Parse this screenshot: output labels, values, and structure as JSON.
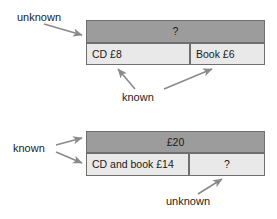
{
  "diagram": {
    "colors": {
      "bar_dark": "#9c9c9c",
      "bar_light": "#e9e9e9",
      "bar_border": "#6f6f6f",
      "arrow": "#8a8a8a",
      "text": "#1c1c1c",
      "background": "#ffffff"
    },
    "models": [
      {
        "id": "model-1",
        "total_label": "?",
        "total_state": "unknown",
        "parts": [
          {
            "label": "CD £8",
            "state": "known"
          },
          {
            "label": "Book £6",
            "state": "known"
          }
        ]
      },
      {
        "id": "model-2",
        "total_label": "£20",
        "total_state": "known",
        "parts": [
          {
            "label": "CD and book £14",
            "state": "known"
          },
          {
            "label": "?",
            "state": "unknown"
          }
        ]
      }
    ],
    "annotations": [
      {
        "id": "unknown-top",
        "text": "unknown",
        "points_to": "model-1-total",
        "arrows": 1
      },
      {
        "id": "known-top",
        "text": "known",
        "points_to": "model-1-parts",
        "arrows": 2
      },
      {
        "id": "known-bottom",
        "text": "known",
        "points_to": "model-2-total-and-part",
        "arrows": 2
      },
      {
        "id": "unknown-bottom",
        "text": "unknown",
        "points_to": "model-2-remainder",
        "arrows": 1
      }
    ]
  }
}
